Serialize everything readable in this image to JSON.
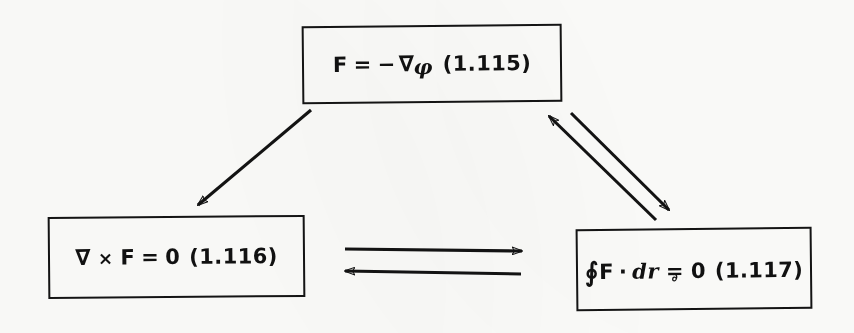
{
  "diagram": {
    "boxes": [
      {
        "id": "gradient-relation",
        "equation_plain": "F = - ∇φ",
        "parts": {
          "lhs_vector": "F",
          "equals": "=",
          "minus": "−",
          "nabla": "∇",
          "phi": "φ"
        },
        "tag": "(1.115)"
      },
      {
        "id": "curl-relation",
        "equation_plain": "∇ × F = 0",
        "parts": {
          "nabla": "∇",
          "times": "×",
          "vector": "F",
          "equals": "=",
          "zero": "0"
        },
        "tag": "(1.116)"
      },
      {
        "id": "circulation-relation",
        "equation_plain": "∮F · dr = 0",
        "parts": {
          "oint": "∮",
          "vector": "F",
          "dot": "·",
          "differential": "dr",
          "equals": "=",
          "equals_smudge": "∂",
          "zero": "0"
        },
        "tag": "(1.117)"
      }
    ],
    "arrows": [
      {
        "id": "top-to-curl",
        "from": "gradient-relation",
        "to": "curl-relation",
        "direction": "down-left",
        "double_headed": false
      },
      {
        "id": "circ-to-top",
        "from": "circulation-relation",
        "to": "gradient-relation",
        "direction": "up-left",
        "double_headed": false
      },
      {
        "id": "top-to-circ",
        "from": "gradient-relation",
        "to": "circulation-relation",
        "direction": "down-right",
        "double_headed": false
      },
      {
        "id": "curl-to-circ",
        "from": "curl-relation",
        "to": "circulation-relation",
        "direction": "right",
        "double_headed": false
      },
      {
        "id": "circ-to-curl",
        "from": "circulation-relation",
        "to": "curl-relation",
        "direction": "left",
        "double_headed": false
      }
    ],
    "colors": {
      "ink": "#131313",
      "paper": "#fdfdfb"
    }
  }
}
